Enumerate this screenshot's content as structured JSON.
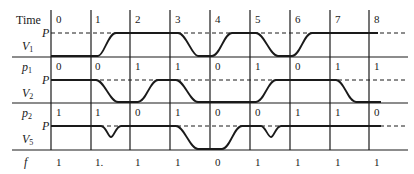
{
  "diagram": {
    "type": "timing-diagram",
    "time_label": "Time",
    "time_ticks": [
      "0",
      "1",
      "2",
      "3",
      "4",
      "5",
      "6",
      "7",
      "8"
    ],
    "level_label": "P",
    "rows": [
      {
        "name": "V1",
        "label_main": "V",
        "label_sub": "1",
        "waveform_levels": [
          "low",
          "high",
          "high",
          "low",
          "high",
          "low",
          "high",
          "high"
        ],
        "description": "V1 rises during interval 1, falls during 3, rises during 4, falls during 5, rises during 6"
      },
      {
        "name": "V2",
        "label_main": "V",
        "label_sub": "2",
        "input_label_main": "p",
        "input_label_sub": "1",
        "input_values": [
          "0",
          "0",
          "1",
          "1",
          "0",
          "1",
          "0",
          "1",
          "1"
        ],
        "waveform_levels": [
          "high",
          "low",
          "high",
          "low",
          "low",
          "high",
          "high",
          "low"
        ]
      },
      {
        "name": "V5",
        "label_main": "V",
        "label_sub": "5",
        "input_label_main": "p",
        "input_label_sub": "2",
        "input_values": [
          "1",
          "1",
          "0",
          "1",
          "0",
          "0",
          "1",
          "1",
          "0"
        ],
        "waveform_levels": [
          "high",
          "glitch",
          "high",
          "low",
          "high",
          "glitch",
          "high",
          "high"
        ]
      }
    ],
    "output": {
      "label": "f",
      "values": [
        "1",
        "1.",
        "1",
        "1",
        "0",
        "1",
        "1",
        "1",
        "1"
      ]
    }
  }
}
